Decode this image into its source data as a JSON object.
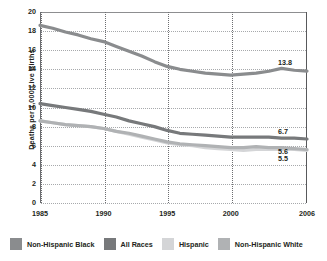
{
  "chart_data": {
    "type": "line",
    "title": "",
    "xlabel": "",
    "ylabel": "Deaths per 1,000 Live Births",
    "xlim": [
      1985,
      2006
    ],
    "ylim": [
      0,
      20
    ],
    "ytick_step": 2,
    "grid": true,
    "legend_position": "bottom",
    "x_ticks": [
      "1985",
      "1990",
      "1995",
      "2000",
      "2006"
    ],
    "x_tick_values": [
      1985,
      1990,
      1995,
      2000,
      2006
    ],
    "y_ticks": [
      "0",
      "2",
      "4",
      "6",
      "8",
      "10",
      "12",
      "14",
      "16",
      "18",
      "20"
    ],
    "y_tick_values": [
      0,
      2,
      4,
      6,
      8,
      10,
      12,
      14,
      16,
      18,
      20
    ],
    "x": [
      1985,
      1986,
      1987,
      1988,
      1989,
      1990,
      1991,
      1992,
      1993,
      1994,
      1995,
      1996,
      1997,
      1998,
      1999,
      2000,
      2001,
      2002,
      2003,
      2004,
      2005,
      2006
    ],
    "series": [
      {
        "name": "Non-Hispanic Black",
        "color": "#8a8c8e",
        "end_label": "13.8",
        "values": [
          18.6,
          18.3,
          17.9,
          17.6,
          17.2,
          16.9,
          16.4,
          15.9,
          15.4,
          14.8,
          14.3,
          14.0,
          13.8,
          13.6,
          13.5,
          13.4,
          13.5,
          13.6,
          13.8,
          14.1,
          13.9,
          13.8
        ]
      },
      {
        "name": "All Races",
        "color": "#77797b",
        "end_label": "6.7",
        "values": [
          10.4,
          10.2,
          10.0,
          9.8,
          9.6,
          9.3,
          9.0,
          8.6,
          8.3,
          8.0,
          7.6,
          7.3,
          7.2,
          7.1,
          7.0,
          6.9,
          6.9,
          6.9,
          6.9,
          6.8,
          6.8,
          6.7
        ]
      },
      {
        "name": "Hispanic",
        "color": "#d4d5d7",
        "end_label": "5.5",
        "values": [
          8.6,
          8.4,
          8.2,
          8.1,
          8.0,
          7.8,
          7.5,
          7.2,
          6.9,
          6.6,
          6.3,
          6.1,
          6.0,
          5.8,
          5.7,
          5.6,
          5.5,
          5.6,
          5.6,
          5.6,
          5.6,
          5.5
        ]
      },
      {
        "name": "Non-Hispanic White",
        "color": "#b0b2b4",
        "end_label": "5.6",
        "values": [
          8.6,
          8.4,
          8.2,
          8.1,
          8.0,
          7.8,
          7.5,
          7.3,
          7.0,
          6.7,
          6.4,
          6.2,
          6.1,
          6.0,
          5.9,
          5.8,
          5.8,
          5.9,
          5.8,
          5.8,
          5.7,
          5.6
        ]
      }
    ],
    "value_labels": [
      {
        "text": "13.8",
        "series": "Non-Hispanic Black",
        "value": 13.8
      },
      {
        "text": "6.7",
        "series": "All Races",
        "value": 6.7
      },
      {
        "text": "5.6",
        "series": "Non-Hispanic White",
        "value": 5.6
      },
      {
        "text": "5.5",
        "series": "Hispanic",
        "value": 5.5
      }
    ],
    "legend": [
      {
        "label": "Non-Hispanic Black",
        "color": "#8a8c8e"
      },
      {
        "label": "All Races",
        "color": "#77797b"
      },
      {
        "label": "Hispanic",
        "color": "#d4d5d7"
      },
      {
        "label": "Non-Hispanic White",
        "color": "#b0b2b4"
      }
    ]
  }
}
